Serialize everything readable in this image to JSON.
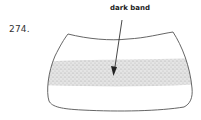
{
  "figure": {
    "number": "274.",
    "callout": {
      "label": "dark band"
    },
    "colors": {
      "outline": "#555555",
      "band": "#c8c8c8",
      "arrow": "#333333",
      "text": "#222222"
    }
  }
}
